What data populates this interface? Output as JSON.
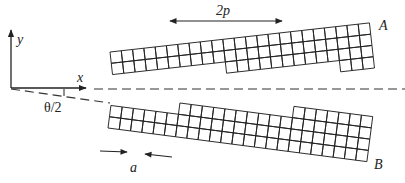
{
  "diagram": {
    "type": "tilt grain boundary schematic",
    "labels": {
      "y_axis": "y",
      "x_axis": "x",
      "angle": "θ/2",
      "period": "2p",
      "spacing": "a",
      "crystal_top": "A",
      "crystal_bottom": "B"
    },
    "colors": {
      "line": "#222222",
      "dash": "#333333",
      "background": "#ffffff"
    },
    "crystal_A": {
      "origin": [
        110,
        52
      ],
      "angle_deg": -6.4,
      "cell": 11.35,
      "column_rows": [
        2,
        2,
        2,
        2,
        2,
        2,
        2,
        2,
        2,
        2,
        3,
        3,
        3,
        3,
        3,
        3,
        3,
        3,
        3,
        3,
        4,
        4,
        4
      ],
      "grow": "down"
    },
    "crystal_B": {
      "origin": [
        108,
        128
      ],
      "angle_deg": 7.4,
      "cell": 11.35,
      "column_rows": [
        2,
        2,
        2,
        2,
        2,
        2,
        3,
        3,
        3,
        3,
        3,
        3,
        3,
        3,
        3,
        3,
        4,
        4,
        4,
        4,
        4,
        4,
        4
      ],
      "grow": "up"
    }
  }
}
